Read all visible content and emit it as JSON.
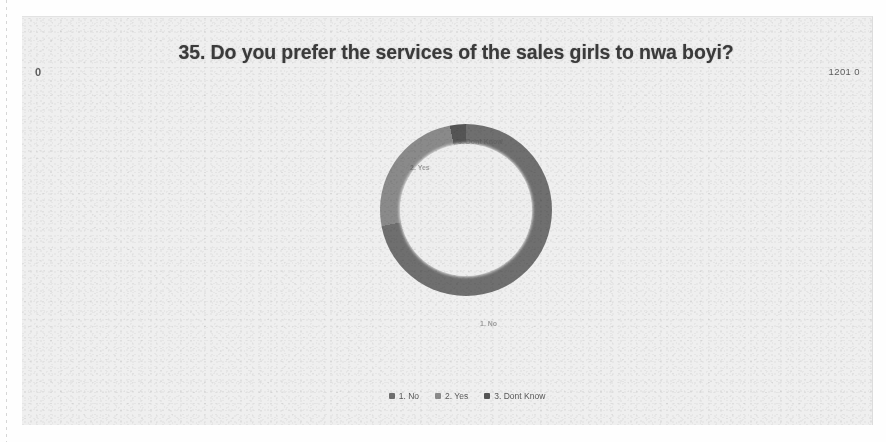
{
  "document": {
    "page_number_left": "0",
    "page_number_right": "1201 0"
  },
  "chart": {
    "title": "35. Do you prefer the services of the sales girls to nwa boyi?",
    "legend": [
      {
        "label": "1. No",
        "color": "#6f6f6f",
        "swatch_name": "legend-swatch-no"
      },
      {
        "label": "2. Yes",
        "color": "#8a8a8a",
        "swatch_name": "legend-swatch-yes"
      },
      {
        "label": "3. Dont Know",
        "color": "#555555",
        "swatch_name": "legend-swatch-dont-know"
      }
    ],
    "slice_labels": {
      "yes": "2. Yes",
      "no": "1. No",
      "dont_know": "3. Dont Know"
    }
  },
  "chart_data": {
    "type": "pie",
    "variant": "donut",
    "title": "35. Do you prefer the services of the sales girls to nwa boyi?",
    "xlabel": "",
    "ylabel": "",
    "legend_position": "bottom",
    "grid": false,
    "hole_ratio": 0.77,
    "start_angle_deg": 0,
    "direction": "clockwise",
    "categories": [
      "1. No",
      "2. Yes",
      "3. Dont Know"
    ],
    "values": [
      72,
      25,
      3
    ],
    "unit": "percent",
    "colors": [
      "#6f6f6f",
      "#8a8a8a",
      "#555555"
    ],
    "series": [
      {
        "name": "Responses",
        "values": [
          72,
          25,
          3
        ]
      }
    ]
  }
}
